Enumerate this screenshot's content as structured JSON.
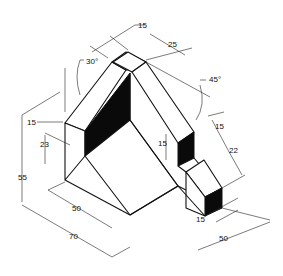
{
  "diagram": {
    "type": "isometric-technical-drawing",
    "colors": {
      "line": "#111111",
      "shade": "#0a0a0a",
      "background": "#ffffff"
    },
    "dimensions": {
      "top_width": "15",
      "top_depth": "25",
      "angle_left": "30°",
      "angle_right": "45°",
      "left_step": "15",
      "left_height": "23",
      "overall_height": "55",
      "base_inner": "50",
      "base_overall": "70",
      "slot_height": "15",
      "right_step": "15",
      "right_height": "22",
      "notch_width": "15",
      "depth_overall": "50"
    }
  }
}
